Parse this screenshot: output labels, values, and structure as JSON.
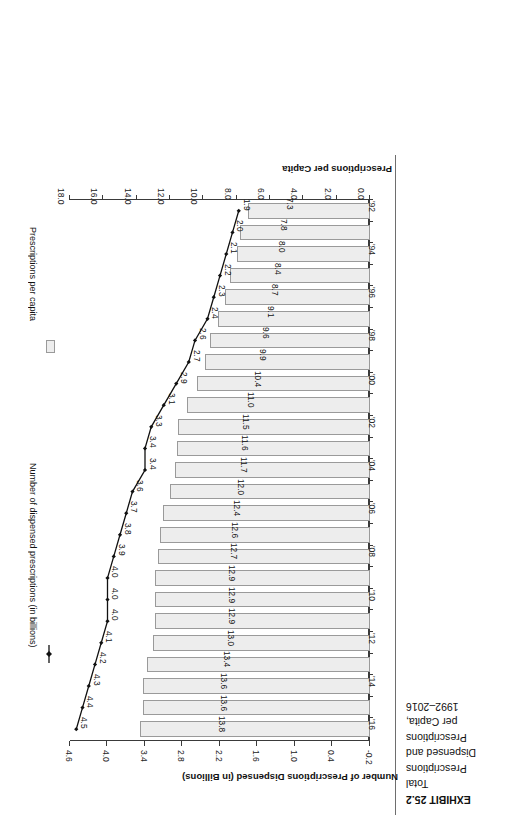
{
  "exhibit": {
    "number_label": "EXHIBIT 25.2",
    "caption_lines": [
      "Total",
      "Prescriptions",
      "Dispensed and",
      "Prescriptions",
      "per Capita,",
      "1992–2016"
    ]
  },
  "axes": {
    "primary_title": "Prescriptions per Capita",
    "secondary_title": "Number of Prescriptions Dispensed (in Billions)",
    "primary_ticks": [
      "0.0",
      "2.0",
      "4.0",
      "6.0",
      "8.0",
      "10.0",
      "12.0",
      "14.0",
      "16.0",
      "18.0"
    ],
    "secondary_ticks": [
      "-0.2",
      "0.4",
      "1.0",
      "1.6",
      "2.2",
      "2.8",
      "3.4",
      "4.0",
      "4.6"
    ],
    "category_ticks": [
      "'92",
      "'94",
      "'96",
      "'98",
      "'00",
      "'02",
      "'04",
      "'06",
      "'08",
      "'10",
      "'12",
      "'14",
      "'16"
    ]
  },
  "legend": {
    "bar_label": "Prescriptions per capita",
    "line_label": "Number of dispensed prescriptions (in billions)"
  },
  "colors": {
    "bar_fill": "#ededed",
    "bar_stroke": "#9a9a9a",
    "line": "#111111",
    "axis": "#3a3a3a",
    "text": "#111111"
  },
  "chart_data": {
    "type": "bar",
    "title": "Total Prescriptions Dispensed and Prescriptions per Capita, 1992–2016",
    "xlabel": "",
    "ylabel": "Prescriptions per Capita",
    "y2label": "Number of Prescriptions Dispensed (in Billions)",
    "orientation": "horizontal",
    "grid": false,
    "legend_position": "right",
    "categories": [
      "'92",
      "'93",
      "'94",
      "'95",
      "'96",
      "'97",
      "'98",
      "'99",
      "'00",
      "'01",
      "'02",
      "'03",
      "'04",
      "'05",
      "'06",
      "'07",
      "'08",
      "'09",
      "'10",
      "'11",
      "'12",
      "'13",
      "'14",
      "'15",
      "'16"
    ],
    "ylim": [
      0.0,
      18.0
    ],
    "y2lim": [
      -0.2,
      4.6
    ],
    "series": [
      {
        "name": "Prescriptions per capita",
        "type": "bar",
        "axis": "primary",
        "unit": "prescriptions per capita",
        "values": [
          7.3,
          7.8,
          8.0,
          8.4,
          8.7,
          9.1,
          9.6,
          9.9,
          10.4,
          11.0,
          11.5,
          11.6,
          11.7,
          12.0,
          12.4,
          12.6,
          12.7,
          12.9,
          12.9,
          12.9,
          13.0,
          13.4,
          13.6,
          13.6,
          13.8
        ],
        "labels": [
          "7.3",
          "7.8",
          "8.0",
          "8.4",
          "8.7",
          "9.1",
          "9.6",
          "9.9",
          "10.4",
          "11.0",
          "11.5",
          "11.6",
          "11.7",
          "12.0",
          "12.4",
          "12.6",
          "12.7",
          "12.9",
          "12.9",
          "12.9",
          "13.0",
          "13.4",
          "13.6",
          "13.6",
          "13.8"
        ]
      },
      {
        "name": "Number of dispensed prescriptions (in billions)",
        "type": "line",
        "axis": "secondary",
        "unit": "billions",
        "values": [
          1.9,
          2.0,
          2.1,
          2.2,
          2.3,
          2.4,
          2.6,
          2.7,
          2.9,
          3.1,
          3.3,
          3.4,
          3.4,
          3.6,
          3.7,
          3.8,
          3.9,
          4.0,
          4.0,
          4.0,
          4.1,
          4.2,
          4.3,
          4.4,
          4.5
        ],
        "labels": [
          "1.9",
          "2.0",
          "2.1",
          "2.2",
          "2.3",
          "2.4",
          "2.6",
          "2.7",
          "2.9",
          "3.1",
          "3.3",
          "3.4",
          "3.4",
          "3.6",
          "3.7",
          "3.8",
          "3.9",
          "4.0",
          "4.0",
          "4.0",
          "4.1",
          "4.2",
          "4.3",
          "4.4",
          "4.5"
        ]
      }
    ]
  }
}
